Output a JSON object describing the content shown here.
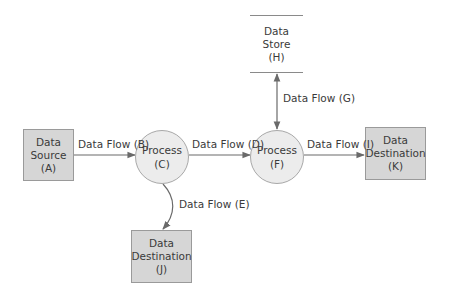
{
  "diagram": {
    "type": "data-flow-diagram",
    "nodes": [
      {
        "id": "A",
        "kind": "external-entity",
        "lines": [
          "Data",
          "Source",
          "(A)"
        ]
      },
      {
        "id": "C",
        "kind": "process",
        "lines": [
          "Process",
          "(C)"
        ]
      },
      {
        "id": "F",
        "kind": "process",
        "lines": [
          "Process",
          "(F)"
        ]
      },
      {
        "id": "H",
        "kind": "data-store",
        "lines": [
          "Data",
          "Store",
          "(H)"
        ]
      },
      {
        "id": "K",
        "kind": "external-entity",
        "lines": [
          "Data",
          "Destination",
          "(K)"
        ]
      },
      {
        "id": "J",
        "kind": "external-entity",
        "lines": [
          "Data",
          "Destination",
          "(J)"
        ]
      }
    ],
    "flows": [
      {
        "id": "B",
        "label": "Data Flow (B)",
        "from": "A",
        "to": "C"
      },
      {
        "id": "D",
        "label": "Data Flow (D)",
        "from": "C",
        "to": "F"
      },
      {
        "id": "G",
        "label": "Data Flow (G)",
        "from": "F",
        "to": "H",
        "bidirectional": true
      },
      {
        "id": "I",
        "label": "Data Flow (I)",
        "from": "F",
        "to": "K"
      },
      {
        "id": "E",
        "label": "Data Flow (E)",
        "from": "C",
        "to": "J"
      }
    ]
  },
  "colors": {
    "entity_fill": "#d6d6d6",
    "process_fill": "#ececec",
    "line": "#6a6a6a",
    "text": "#3a3a3a"
  }
}
